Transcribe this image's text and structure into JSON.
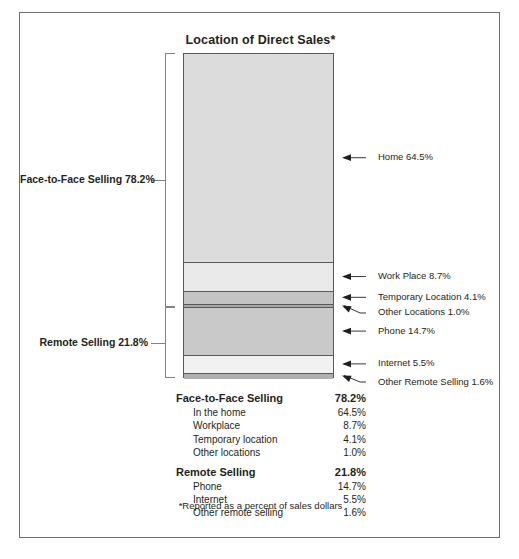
{
  "chart_data": {
    "type": "bar",
    "title": "Location of Direct Sales*",
    "subtitle": "",
    "xlabel": "",
    "ylabel": "",
    "ylim": [
      0,
      100
    ],
    "grid": false,
    "legend_position": "below",
    "orientation": "vertical-stacked",
    "units": "percent of sales dollars",
    "categories": [
      "Home",
      "Work Place",
      "Temporary Location",
      "Other Locations",
      "Phone",
      "Internet",
      "Other Remote Selling"
    ],
    "values": [
      64.5,
      8.7,
      4.1,
      1.0,
      14.7,
      5.5,
      1.6
    ],
    "groups": [
      {
        "name": "Face-to-Face Selling",
        "value": 78.2,
        "members": [
          "Home",
          "Work Place",
          "Temporary Location",
          "Other Locations"
        ]
      },
      {
        "name": "Remote Selling",
        "value": 21.8,
        "members": [
          "Phone",
          "Internet",
          "Other Remote Selling"
        ]
      }
    ],
    "segment_colors": [
      "#dcdcdc",
      "#eaeaea",
      "#c4c4c4",
      "#a8a8a8",
      "#c9c9c9",
      "#f1f1f1",
      "#b0b0b0"
    ]
  },
  "title": "Location of Direct Sales*",
  "footnote": "*Reported as a percent of sales dollars",
  "group_labels": {
    "face_to_face": "Face-to-Face Selling  78.2%",
    "remote": "Remote Selling  21.8%"
  },
  "callouts": [
    {
      "label": "Home  64.5%"
    },
    {
      "label": "Work Place  8.7%"
    },
    {
      "label": "Temporary Location  4.1%"
    },
    {
      "label": "Other Locations  1.0%"
    },
    {
      "label": "Phone  14.7%"
    },
    {
      "label": "Internet  5.5%"
    },
    {
      "label": "Other Remote Selling  1.6%"
    }
  ],
  "legend": [
    {
      "name": "Face-to-Face Selling",
      "value": "78.2%",
      "type": "head"
    },
    {
      "name": "In the home",
      "value": "64.5%",
      "type": "sub"
    },
    {
      "name": "Workplace",
      "value": "8.7%",
      "type": "sub"
    },
    {
      "name": "Temporary location",
      "value": "4.1%",
      "type": "sub"
    },
    {
      "name": "Other locations",
      "value": "1.0%",
      "type": "sub"
    },
    {
      "name": "Remote Selling",
      "value": "21.8%",
      "type": "head"
    },
    {
      "name": "Phone",
      "value": "14.7%",
      "type": "sub"
    },
    {
      "name": "Internet",
      "value": "5.5%",
      "type": "sub"
    },
    {
      "name": "Other remote selling",
      "value": "1.6%",
      "type": "sub"
    }
  ],
  "colors": {
    "frame": "#6d6e71",
    "bar_border": "#58595b",
    "text": "#231f20",
    "leader": "#231f20"
  }
}
